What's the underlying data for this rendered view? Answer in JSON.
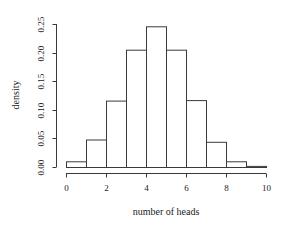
{
  "chart_data": {
    "type": "bar",
    "subtype": "histogram",
    "title": "",
    "xlabel": "number of heads",
    "ylabel": "density",
    "bin_edges": [
      0,
      1,
      2,
      3,
      4,
      5,
      6,
      7,
      8,
      9,
      10
    ],
    "categories": [
      "0-1",
      "1-2",
      "2-3",
      "3-4",
      "4-5",
      "5-6",
      "6-7",
      "7-8",
      "8-9",
      "9-10"
    ],
    "values": [
      0.01,
      0.048,
      0.116,
      0.205,
      0.246,
      0.205,
      0.117,
      0.044,
      0.01,
      0.002
    ],
    "xlim": [
      0,
      10
    ],
    "ylim": [
      0,
      0.25
    ],
    "xticks": [
      0,
      2,
      4,
      6,
      8,
      10
    ],
    "xtick_labels": [
      "0",
      "2",
      "4",
      "6",
      "8",
      "10"
    ],
    "yticks": [
      0.0,
      0.05,
      0.1,
      0.15,
      0.2,
      0.25
    ],
    "ytick_labels": [
      "0.00",
      "0.05",
      "0.10",
      "0.15",
      "0.20",
      "0.25"
    ],
    "grid": false,
    "legend": null,
    "colors": {
      "bar_fill": "#ffffff",
      "bar_stroke": "#3a3a3a"
    }
  }
}
